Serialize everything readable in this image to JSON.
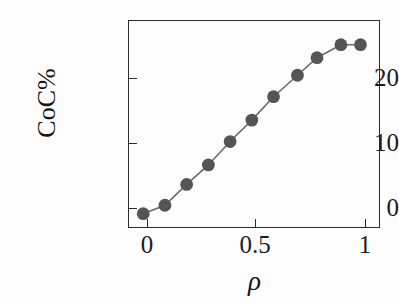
{
  "chart_data": {
    "type": "line",
    "title": "",
    "subtitle": "",
    "xlabel": "ρ",
    "ylabel": "CoC%",
    "xlim": [
      -0.07,
      1.09
    ],
    "ylim": [
      -2.2,
      29.8
    ],
    "xticks": [
      "0",
      "0.5",
      "1"
    ],
    "xtick_values": [
      0,
      0.5,
      1
    ],
    "yticks": [
      "0",
      "10",
      "20"
    ],
    "ytick_values": [
      0,
      10,
      20
    ],
    "grid": false,
    "legend": "none",
    "marker": "filled-circle",
    "marker_color": "#555555",
    "line_color": "#6b6b6b",
    "frame_color": "#2b2b2b",
    "series": [
      {
        "name": "CoC%",
        "x": [
          0.0,
          0.1,
          0.2,
          0.3,
          0.4,
          0.5,
          0.6,
          0.71,
          0.8,
          0.91,
          1.0
        ],
        "y": [
          0.0,
          1.3,
          4.5,
          7.5,
          11.1,
          14.4,
          18.0,
          21.3,
          24.0,
          26.0,
          26.0
        ]
      }
    ]
  },
  "axes": {
    "y_tick_labels": [
      "20",
      "10",
      "0"
    ],
    "x_tick_labels": [
      "0",
      "0.5",
      "1"
    ],
    "y_axis_title": "CoC%",
    "x_axis_title": "ρ"
  }
}
